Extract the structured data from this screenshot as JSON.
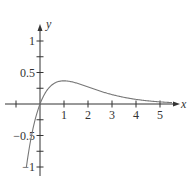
{
  "chart_data": {
    "type": "line",
    "title": "",
    "function": "y = x e^(-x)",
    "xlabel": "x",
    "ylabel": "y",
    "xlim": [
      -1.2,
      6
    ],
    "ylim": [
      -1.05,
      1.25
    ],
    "grid": false,
    "legend": null,
    "x_ticks": [
      -1,
      1,
      2,
      3,
      4,
      5
    ],
    "x_tick_labels": [
      "1",
      "2",
      "3",
      "4",
      "5"
    ],
    "y_ticks": [
      -1,
      -0.75,
      -0.5,
      -0.25,
      0.25,
      0.5,
      0.75,
      1
    ],
    "y_tick_labels": [
      "1",
      "0.5",
      "−0.5",
      "−1"
    ],
    "series": [
      {
        "name": "y = x e^(-x)",
        "color": "#777777",
        "x": [
          -0.57,
          -0.4,
          -0.2,
          0,
          0.25,
          0.5,
          0.75,
          1,
          1.5,
          2,
          2.5,
          3,
          3.5,
          4,
          4.5,
          5,
          5.5
        ],
        "y": [
          -1.01,
          -0.6,
          -0.24,
          0,
          0.195,
          0.303,
          0.354,
          0.368,
          0.335,
          0.271,
          0.205,
          0.149,
          0.106,
          0.073,
          0.05,
          0.034,
          0.022
        ]
      }
    ],
    "colors": {
      "axis": "#333333",
      "curve": "#777777"
    }
  }
}
